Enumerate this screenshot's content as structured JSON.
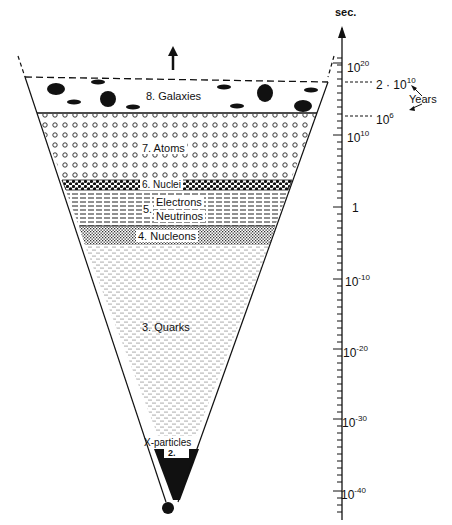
{
  "diagram": {
    "layers": [
      {
        "id": 8,
        "label": "8. Galaxies",
        "pattern": "black-ellipses"
      },
      {
        "id": 7,
        "label": "7. Atoms",
        "pattern": "open-circles"
      },
      {
        "id": 6,
        "label": "6. Nuclei",
        "pattern": "checkered-dots"
      },
      {
        "id": 5,
        "label_line1": "Electrons",
        "label_line2": "Neutrinos",
        "label_num": "5.",
        "pattern": "dashes"
      },
      {
        "id": 4,
        "label": "4. Nucleons",
        "pattern": "fine-crosshatch"
      },
      {
        "id": 3,
        "label": "3. Quarks",
        "pattern": "stipple"
      },
      {
        "id": 2,
        "label_above": "X-particles",
        "label": "2.",
        "pattern": "solid-black"
      }
    ],
    "axis": {
      "unit": "sec.",
      "ticks": [
        {
          "base": "10",
          "exp": "20"
        },
        {
          "base": "10",
          "exp": "10"
        },
        {
          "base": "1",
          "exp": ""
        },
        {
          "base": "10",
          "exp": "-10"
        },
        {
          "base": "10",
          "exp": "-20"
        },
        {
          "base": "10",
          "exp": "-30"
        },
        {
          "base": "10",
          "exp": "-40"
        }
      ],
      "markers": [
        {
          "base": "2 · 10",
          "exp": "10"
        },
        {
          "base": "10",
          "exp": "6"
        }
      ],
      "years_label": "Years"
    },
    "colors": {
      "ink": "#111111",
      "background": "#ffffff"
    }
  }
}
